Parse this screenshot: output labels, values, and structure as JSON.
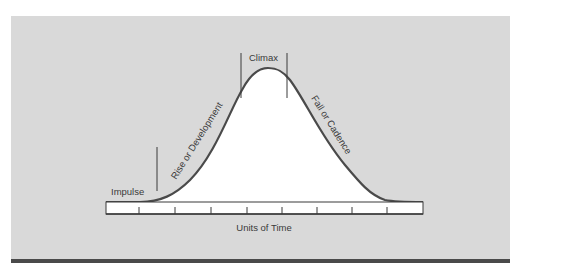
{
  "diagram": {
    "labels": {
      "impulse": "Impulse",
      "rise": "Rise or Development",
      "climax": "Climax",
      "fall": "Fall or Cadence",
      "x_axis": "Units of Time"
    },
    "tick_count": 8,
    "colors": {
      "background": "#d9d9d9",
      "curve": "#4a4a4a",
      "fill": "#ffffff",
      "bottom_bar": "#4a4a4a",
      "text": "#3a3a3a"
    }
  }
}
